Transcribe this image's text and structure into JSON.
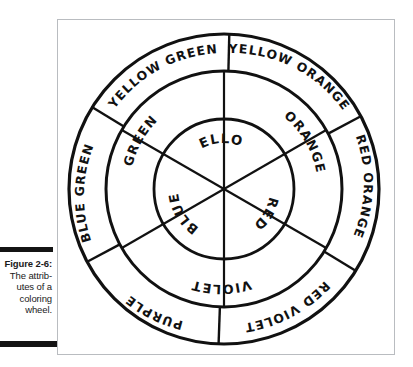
{
  "caption": {
    "figure_number": "Figure 2-6:",
    "line_1": "The attrib-",
    "line_2": "utes of a",
    "line_3": "coloring",
    "line_4": "wheel."
  },
  "figure": {
    "line_color": "#111111",
    "background_color": "#ffffff",
    "frame_color": "#b9bcc0"
  },
  "wheel": {
    "center_x": 166,
    "center_y": 169,
    "radius_outer": 155,
    "radius_middle": 118,
    "radius_inner": 70,
    "rings": [
      {
        "name": "inner-ring",
        "sector_count": 3,
        "labels": [
          "YELLOW",
          "RED",
          "BLUE"
        ]
      },
      {
        "name": "middle-ring",
        "sector_count": 3,
        "labels": [
          "ORANGE",
          "VIOLET",
          "GREEN"
        ]
      },
      {
        "name": "outer-ring",
        "sector_count": 6,
        "labels": [
          "YELLOW ORANGE",
          "RED ORANGE",
          "RED VIOLET",
          "PURPLE",
          "BLUE GREEN",
          "YELLOW GREEN"
        ]
      }
    ],
    "labels": {
      "yellow": "YELLOW",
      "red": "RED",
      "blue": "BLUE",
      "orange": "ORANGE",
      "violet": "VIOLET",
      "green": "GREEN",
      "yellow_orange": "YELLOW ORANGE",
      "red_orange": "RED ORANGE",
      "red_violet": "RED VIOLET",
      "purple": "PURPLE",
      "blue_green": "BLUE GREEN",
      "yellow_green": "YELLOW GREEN"
    }
  }
}
